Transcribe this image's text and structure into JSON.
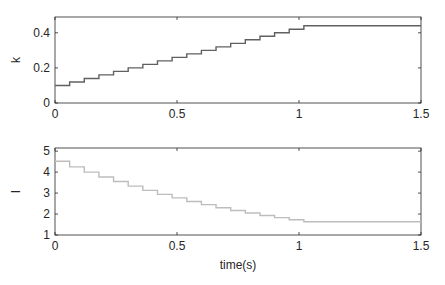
{
  "chart_data": [
    {
      "type": "line",
      "step": true,
      "title": "",
      "xlabel": "",
      "ylabel": "k",
      "xlim": [
        0,
        1.5
      ],
      "ylim": [
        0,
        0.49
      ],
      "xticks": [
        0,
        0.5,
        1,
        1.5
      ],
      "xtick_labels": [
        "0",
        "0.5",
        "1",
        "1.5"
      ],
      "yticks": [
        0,
        0.2,
        0.4
      ],
      "ytick_labels": [
        "0",
        "0.2",
        "0.4"
      ],
      "grid": false,
      "color": "#606060",
      "x": [
        0,
        0.06,
        0.12,
        0.18,
        0.24,
        0.3,
        0.36,
        0.42,
        0.48,
        0.54,
        0.6,
        0.66,
        0.72,
        0.78,
        0.84,
        0.9,
        0.96,
        1.02,
        1.5
      ],
      "values": [
        0.1,
        0.12,
        0.14,
        0.16,
        0.18,
        0.2,
        0.22,
        0.24,
        0.26,
        0.28,
        0.3,
        0.32,
        0.34,
        0.36,
        0.38,
        0.4,
        0.42,
        0.44,
        0.44
      ]
    },
    {
      "type": "line",
      "step": true,
      "title": "",
      "xlabel": "time(s)",
      "ylabel": "I",
      "xlim": [
        0,
        1.5
      ],
      "ylim": [
        1,
        5.15
      ],
      "xticks": [
        0,
        0.5,
        1,
        1.5
      ],
      "xtick_labels": [
        "0",
        "0.5",
        "1",
        "1.5"
      ],
      "yticks": [
        1,
        2,
        3,
        4,
        5
      ],
      "ytick_labels": [
        "1",
        "2",
        "3",
        "4",
        "5"
      ],
      "grid": false,
      "color": "#bdbdbd",
      "x": [
        0,
        0.06,
        0.12,
        0.18,
        0.24,
        0.3,
        0.36,
        0.42,
        0.48,
        0.54,
        0.6,
        0.66,
        0.72,
        0.78,
        0.84,
        0.9,
        0.96,
        1.02,
        1.5
      ],
      "values": [
        4.52,
        4.25,
        4.0,
        3.77,
        3.55,
        3.33,
        3.13,
        2.94,
        2.77,
        2.6,
        2.45,
        2.3,
        2.17,
        2.05,
        1.93,
        1.83,
        1.73,
        1.63,
        1.63
      ]
    }
  ]
}
